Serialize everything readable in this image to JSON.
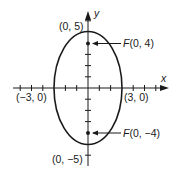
{
  "diagram": {
    "type": "ellipse-graph",
    "equation_shape": "vertical ellipse centered at origin",
    "axes": {
      "x_label": "x",
      "y_label": "y"
    },
    "vertices": {
      "top": "(0, 5)",
      "bottom": "(0, −5)",
      "left": "(−3, 0)",
      "right": "(3, 0)"
    },
    "foci": {
      "upper": "F(0, 4)",
      "lower": "F(0, −4)"
    },
    "colors": {
      "stroke": "#1a1a1a",
      "background": "#ffffff"
    }
  }
}
